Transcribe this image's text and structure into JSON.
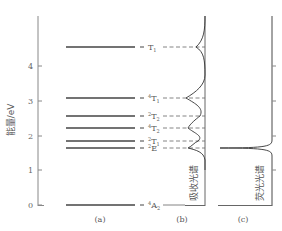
{
  "axis": {
    "label": "能量/eV",
    "ticks": [
      {
        "value": "0",
        "y": 205
      },
      {
        "value": "1",
        "y": 170
      },
      {
        "value": "2",
        "y": 136
      },
      {
        "value": "3",
        "y": 101
      },
      {
        "value": "4",
        "y": 66
      }
    ]
  },
  "levels": [
    {
      "sup": "",
      "base": "T",
      "sub": "1",
      "y": 47
    },
    {
      "sup": "4",
      "base": "T",
      "sub": "1",
      "y": 98
    },
    {
      "sup": "2",
      "base": "T",
      "sub": "2",
      "y": 116
    },
    {
      "sup": "4",
      "base": "T",
      "sub": "2",
      "y": 128
    },
    {
      "sup": "2",
      "base": "T",
      "sub": "1",
      "y": 141
    },
    {
      "sup": "2",
      "base": "E",
      "sub": "",
      "y": 148
    },
    {
      "sup": "4",
      "base": "A",
      "sub": "2",
      "y": 205
    }
  ],
  "panels": {
    "a": "(a)",
    "b": "(b)",
    "c": "(c)"
  },
  "spectra": {
    "absorption_label": "吸收光谱",
    "fluorescence_label": "荧光光谱"
  },
  "colors": {
    "line": "#444444",
    "dashed": "#777777",
    "text": "#555555"
  }
}
